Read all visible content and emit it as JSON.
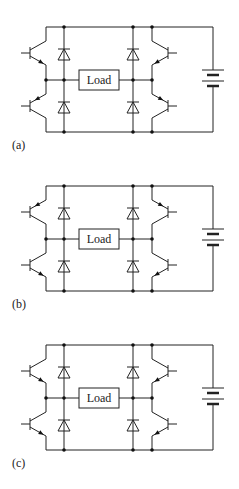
{
  "figure": {
    "panels": [
      {
        "label": "(a)",
        "offset_y": 0,
        "load_label": "Load",
        "transistors": {
          "left_top": {
            "emitter": "bottom",
            "arrow": "out"
          },
          "left_bottom": {
            "emitter": "top",
            "arrow": "in"
          },
          "right_top": {
            "emitter": "bottom",
            "arrow": "out"
          },
          "right_bottom": {
            "emitter": "top",
            "arrow": "in"
          }
        }
      },
      {
        "label": "(b)",
        "offset_y": 159,
        "load_label": "Load",
        "transistors": {
          "left_top": {
            "emitter": "top",
            "arrow": "in"
          },
          "left_bottom": {
            "emitter": "bottom",
            "arrow": "out"
          },
          "right_top": {
            "emitter": "top",
            "arrow": "in"
          },
          "right_bottom": {
            "emitter": "bottom",
            "arrow": "out"
          }
        }
      },
      {
        "label": "(c)",
        "offset_y": 318,
        "load_label": "Load",
        "transistors": {
          "left_top": {
            "emitter": "bottom",
            "arrow": "out"
          },
          "left_bottom": {
            "emitter": "bottom",
            "arrow": "out"
          },
          "right_top": {
            "emitter": "bottom",
            "arrow": "out"
          },
          "right_bottom": {
            "emitter": "bottom",
            "arrow": "out"
          }
        }
      }
    ],
    "colors": {
      "line": "#222222",
      "background": "#ffffff"
    }
  }
}
